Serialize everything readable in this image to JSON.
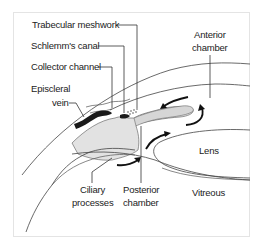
{
  "diagram": {
    "labels": {
      "trabecular_meshwork": "Trabecular meshwork",
      "schlemms_canal": "Schlemm's canal",
      "collector_channel": "Collector channel",
      "episcleral_vein_line1": "Episcleral",
      "episcleral_vein_line2": "vein",
      "anterior_chamber_line1": "Anterior",
      "anterior_chamber_line2": "chamber",
      "lens": "Lens",
      "ciliary_processes_line1": "Ciliary",
      "ciliary_processes_line2": "processes",
      "posterior_chamber_line1": "Posterior",
      "posterior_chamber_line2": "chamber",
      "vitreous": "Vitreous"
    },
    "colors": {
      "tissue_fill": "#e2e2e2",
      "vein": "#1a1a1a",
      "lines": "#444444",
      "text": "#222222"
    }
  }
}
